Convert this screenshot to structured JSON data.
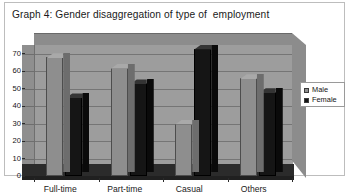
{
  "figure": {
    "title": "Graph 4: Gender disaggregation of type of  employment"
  },
  "legend": {
    "position": "top-right",
    "entries": [
      {
        "label": "Male",
        "color": "#8e8e8e",
        "icon": "square-swatch"
      },
      {
        "label": "Female",
        "color": "#151515",
        "icon": "square-swatch"
      }
    ]
  },
  "chart_data": {
    "type": "bar",
    "title": "Graph 4: Gender disaggregation of type of  employment",
    "subtitle": "",
    "xlabel": "",
    "ylabel": "",
    "categories": [
      "Full-time",
      "Part-time",
      "Casual",
      "Others"
    ],
    "series": [
      {
        "name": "Male",
        "color": "#8e8e8e",
        "values": [
          68,
          62,
          30,
          56
        ]
      },
      {
        "name": "Female",
        "color": "#151515",
        "values": [
          45,
          53,
          73,
          48
        ]
      }
    ],
    "yticks": [
      0,
      10,
      20,
      30,
      40,
      50,
      60,
      70
    ],
    "ylim": [
      0,
      75
    ],
    "grid": true,
    "legend_position": "top-right",
    "three_d": true
  }
}
